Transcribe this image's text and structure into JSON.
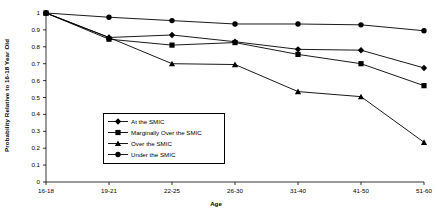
{
  "chart_data": {
    "type": "line",
    "title": "",
    "xlabel": "Age",
    "ylabel": "Probability Relative to 16-18 Year Old",
    "categories": [
      "16-18",
      "19-21",
      "22-25",
      "26-30",
      "31-40",
      "41-50",
      "51-60"
    ],
    "ylim": [
      0,
      1
    ],
    "ytick_labels": [
      "0",
      "0.1",
      "0.2",
      "0.3",
      "0.4",
      "0.5",
      "0.6",
      "0.7",
      "0.8",
      "0.9",
      "1"
    ],
    "ytick_values": [
      0,
      0.1,
      0.2,
      0.3,
      0.4,
      0.5,
      0.6,
      0.7,
      0.8,
      0.9,
      1
    ],
    "grid": false,
    "legend_position": "inside-lower-center",
    "series": [
      {
        "name": "At the SMIC",
        "marker": "diamond",
        "values": [
          1.0,
          0.855,
          0.87,
          0.83,
          0.785,
          0.78,
          0.675
        ]
      },
      {
        "name": "Marginally Over the SMIC",
        "marker": "square",
        "values": [
          1.0,
          0.845,
          0.81,
          0.825,
          0.755,
          0.7,
          0.57
        ]
      },
      {
        "name": "Over the SMIC",
        "marker": "triangle",
        "values": [
          1.0,
          0.855,
          0.7,
          0.695,
          0.535,
          0.505,
          0.235
        ]
      },
      {
        "name": "Under the SMIC",
        "marker": "circle",
        "values": [
          1.0,
          0.975,
          0.955,
          0.935,
          0.935,
          0.93,
          0.895
        ]
      }
    ]
  },
  "axis": {
    "x_title": "Age",
    "y_title": "Probability Relative to 16-18 Year Old"
  }
}
